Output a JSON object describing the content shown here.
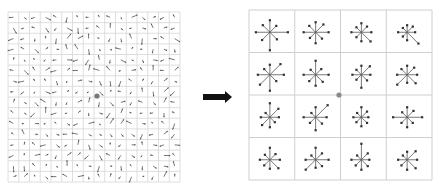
{
  "diagram": {
    "title": "",
    "left_panel": {
      "name": "image-gradients",
      "grid_rows": 16,
      "grid_cols": 16,
      "x": 8,
      "y": 12,
      "width": 172,
      "height": 170,
      "grid_color": "#d6d6d6",
      "arrow_color": "#555555",
      "keypoint": {
        "cx": 97,
        "cy": 96,
        "color": "#777777"
      }
    },
    "arrow": {
      "name": "transform-arrow",
      "x1": 203,
      "x2": 232,
      "y": 97,
      "color": "#111111"
    },
    "right_panel": {
      "name": "keypoint-descriptor",
      "grid_rows": 4,
      "grid_cols": 4,
      "x": 249,
      "y": 10,
      "width": 183,
      "height": 170,
      "grid_color": "#cfcfcf",
      "star_color": "#555555",
      "keypoint": {
        "cx": 339,
        "cy": 95,
        "color": "#8a8a8a"
      },
      "histograms": [
        [
          18,
          9,
          12,
          10,
          14,
          11,
          18,
          10
        ],
        [
          13,
          11,
          10,
          9,
          12,
          8,
          11,
          9
        ],
        [
          10,
          8,
          9,
          7,
          10,
          7,
          9,
          13
        ],
        [
          8,
          8,
          7,
          6,
          9,
          6,
          8,
          16
        ],
        [
          14,
          15,
          10,
          8,
          12,
          14,
          16,
          9
        ],
        [
          13,
          8,
          14,
          7,
          12,
          9,
          11,
          10
        ],
        [
          9,
          12,
          9,
          7,
          9,
          7,
          13,
          8
        ],
        [
          10,
          10,
          9,
          8,
          10,
          14,
          8,
          12
        ],
        [
          9,
          12,
          14,
          6,
          9,
          11,
          10,
          7
        ],
        [
          11,
          17,
          10,
          6,
          12,
          8,
          13,
          9
        ],
        [
          7,
          8,
          10,
          6,
          8,
          7,
          9,
          8
        ],
        [
          15,
          9,
          10,
          7,
          14,
          8,
          10,
          8
        ],
        [
          10,
          8,
          12,
          7,
          10,
          8,
          9,
          12
        ],
        [
          13,
          9,
          12,
          6,
          10,
          14,
          8,
          9
        ],
        [
          8,
          9,
          16,
          6,
          10,
          8,
          10,
          9
        ],
        [
          10,
          12,
          8,
          6,
          9,
          8,
          10,
          12
        ]
      ]
    }
  }
}
